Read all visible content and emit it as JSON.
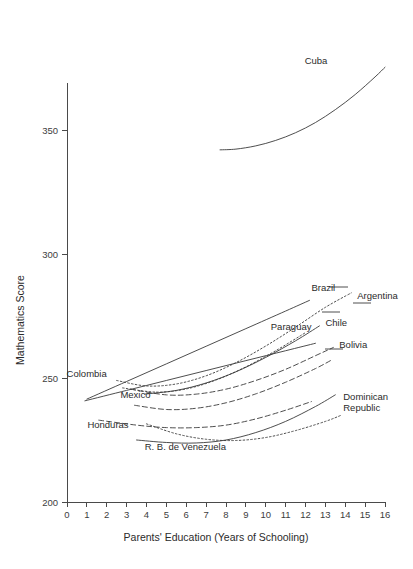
{
  "chart_data": {
    "type": "line",
    "title": "",
    "subtitle": "",
    "xlabel": "Parents' Education (Years of Schooling)",
    "ylabel": "Mathematics Score",
    "xlim": [
      0,
      16
    ],
    "ylim": [
      200,
      385
    ],
    "grid": false,
    "legend_position": "inline-labels",
    "x_ticks": [
      0,
      1,
      2,
      3,
      4,
      5,
      6,
      7,
      8,
      9,
      10,
      11,
      12,
      13,
      14,
      15,
      16
    ],
    "x_tick_labels": [
      "0",
      "1",
      "2",
      "3",
      "4",
      "5",
      "6",
      "7",
      "8",
      "9",
      "10",
      "11",
      "12",
      "13",
      "14",
      "15",
      "16"
    ],
    "y_ticks": [
      200,
      250,
      300,
      350
    ],
    "y_tick_labels": [
      "200",
      "250",
      "300",
      "350"
    ],
    "line_color": "#3a3a3a",
    "series": [
      {
        "name": "Cuba",
        "style": "solid",
        "label_x": 13.1,
        "label_y": 376.5,
        "label_anchor": "end",
        "x": [
          7.7,
          8.5,
          9.5,
          10.5,
          11.5,
          12.5,
          13.5,
          14.5,
          15.5,
          16.0
        ],
        "y": [
          342.0,
          342.3,
          343.6,
          345.8,
          348.9,
          353.0,
          358.2,
          364.3,
          371.4,
          375.3
        ]
      },
      {
        "name": "Brazil",
        "style": "solid",
        "label_x": 12.3,
        "label_y": 285.0,
        "label_anchor": "start",
        "x": [
          1.0,
          3.0,
          5.0,
          7.0,
          9.0,
          11.0,
          12.2
        ],
        "y": [
          241.5,
          248.6,
          255.7,
          262.8,
          269.9,
          277.0,
          281.3
        ]
      },
      {
        "name": "Argentina",
        "style": "dotted",
        "label_x": 14.6,
        "label_y": 282.0,
        "label_anchor": "start",
        "x": [
          2.5,
          4.0,
          5.5,
          7.0,
          8.5,
          10.0,
          11.5,
          13.0,
          14.3
        ],
        "y": [
          249.0,
          246.8,
          247.6,
          250.9,
          256.2,
          262.9,
          270.5,
          278.5,
          284.3
        ]
      },
      {
        "name": "Paraguay",
        "style": "dotted",
        "label_x": 12.3,
        "label_y": 269.5,
        "label_anchor": "end",
        "x": [
          2.8,
          4.5,
          6.0,
          7.5,
          9.0,
          10.5,
          12.0
        ],
        "y": [
          246.0,
          244.3,
          245.6,
          249.2,
          254.5,
          261.0,
          268.3
        ]
      },
      {
        "name": "Chile",
        "style": "solid",
        "label_x": 13.0,
        "label_y": 271.0,
        "label_anchor": "start",
        "x": [
          3.9,
          5.5,
          7.0,
          8.5,
          10.0,
          11.5,
          12.7
        ],
        "y": [
          243.5,
          245.0,
          248.0,
          252.5,
          258.3,
          265.0,
          271.0
        ]
      },
      {
        "name": "Colombia",
        "style": "solid",
        "label_x": 2.0,
        "label_y": 250.5,
        "label_anchor": "end",
        "x": [
          0.9,
          3.0,
          5.0,
          7.0,
          9.0,
          11.0,
          12.5
        ],
        "y": [
          240.8,
          245.0,
          249.0,
          253.0,
          257.0,
          261.0,
          264.0
        ]
      },
      {
        "name": "Bolivia",
        "style": "dashed",
        "label_x": 13.7,
        "label_y": 262.0,
        "label_anchor": "start",
        "x": [
          3.2,
          5.0,
          6.5,
          8.0,
          9.5,
          11.0,
          12.5,
          13.4
        ],
        "y": [
          245.5,
          243.2,
          243.5,
          245.5,
          249.0,
          253.5,
          259.0,
          262.3
        ]
      },
      {
        "name": "Mexico",
        "style": "dashed",
        "label_x": 4.2,
        "label_y": 242.0,
        "label_anchor": "end",
        "x": [
          3.4,
          5.0,
          6.5,
          8.0,
          9.5,
          11.0,
          12.5,
          13.3
        ],
        "y": [
          239.0,
          237.3,
          237.8,
          240.0,
          243.6,
          248.3,
          253.8,
          257.2
        ]
      },
      {
        "name": "Honduras",
        "style": "dashed",
        "label_x": 3.1,
        "label_y": 230.0,
        "label_anchor": "end",
        "x": [
          1.6,
          3.5,
          5.0,
          6.5,
          8.0,
          9.5,
          11.0,
          12.3
        ],
        "y": [
          233.0,
          231.0,
          230.0,
          230.0,
          231.0,
          233.5,
          237.0,
          240.5
        ]
      },
      {
        "name": "R. B. de Venezuela",
        "style": "solid",
        "label_x": 8.0,
        "label_y": 221.0,
        "label_anchor": "end",
        "x": [
          3.5,
          5.0,
          6.5,
          8.0,
          9.5,
          11.0,
          12.5,
          13.5
        ],
        "y": [
          225.0,
          224.0,
          223.8,
          225.0,
          228.0,
          232.5,
          238.5,
          243.2
        ]
      },
      {
        "name": "Dominican Republic",
        "style": "dotted",
        "label_x": 13.9,
        "label_y": 241.0,
        "label_anchor": "start",
        "x": [
          4.0,
          5.5,
          7.0,
          8.5,
          10.0,
          11.5,
          13.0,
          13.8
        ],
        "y": [
          231.5,
          227.5,
          225.3,
          224.8,
          226.0,
          228.8,
          232.5,
          235.0
        ]
      }
    ]
  },
  "labels": {
    "cuba": "Cuba",
    "brazil": "Brazil",
    "argentina": "Argentina",
    "paraguay": "Paraguay",
    "chile": "Chile",
    "colombia": "Colombia",
    "bolivia": "Bolivia",
    "mexico": "Mexico",
    "honduras": "Honduras",
    "venezuela": "R. B. de Venezuela",
    "dominican_republic_line1": "Dominican",
    "dominican_republic_line2": "Republic"
  }
}
